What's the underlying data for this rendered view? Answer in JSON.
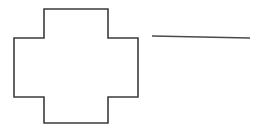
{
  "canvas": {
    "width": 265,
    "height": 129,
    "background_color": "#ffffff"
  },
  "figure": {
    "title": "",
    "shapes": [
      {
        "name": "cross-shape",
        "kind": "polygon",
        "label": "plus-cross-outline",
        "stroke_color": "#3b3b3b",
        "stroke_width": 1.6,
        "fill_color": "none",
        "points": "44,9 108,9 108,38 138,38 138,97 108,97 108,123 44,123 44,97 14,97 14,38 44,38",
        "bounds": {
          "x": 14,
          "y": 9,
          "width": 124,
          "height": 114
        }
      },
      {
        "name": "horizontal-line",
        "kind": "line",
        "label": "line-segment",
        "stroke_color": "#4a4a4a",
        "stroke_width": 1.4,
        "x1": 152,
        "y1": 36,
        "x2": 250,
        "y2": 38,
        "length": 98
      }
    ]
  }
}
